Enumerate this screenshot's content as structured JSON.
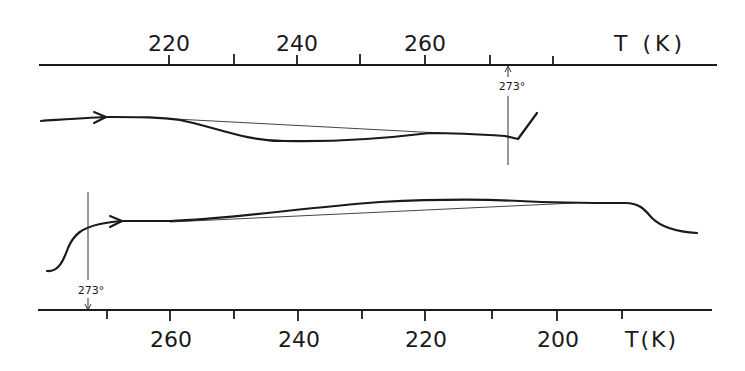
{
  "figure": {
    "top_panel": {
      "axis": {
        "title": "T (K)",
        "tick_labels": [
          {
            "value": "220",
            "x": 169
          },
          {
            "value": "240",
            "x": 297
          },
          {
            "value": "260",
            "x": 425
          }
        ],
        "major_ticks_x": [
          169,
          297,
          425
        ],
        "minor_ticks_x": [
          234,
          360,
          490,
          553
        ],
        "direction": "increasing left-to-right"
      },
      "marker": {
        "label": "273°",
        "x": 508,
        "arrow": "up"
      },
      "curve_direction": "heating (arrow pointing right)"
    },
    "bottom_panel": {
      "axis": {
        "title": "T(K)",
        "tick_labels": [
          {
            "value": "260",
            "x": 170
          },
          {
            "value": "240",
            "x": 298
          },
          {
            "value": "220",
            "x": 425
          },
          {
            "value": "200",
            "x": 557
          }
        ],
        "major_ticks_x": [
          170,
          298,
          425,
          557
        ],
        "minor_ticks_x": [
          107,
          234,
          362,
          492,
          622
        ],
        "direction": "decreasing left-to-right"
      },
      "marker": {
        "label": "273°",
        "x": 88,
        "arrow": "down"
      },
      "curve_direction": "cooling (arrow pointing right)"
    }
  }
}
